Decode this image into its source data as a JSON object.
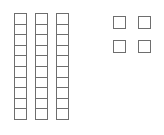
{
  "diagram": {
    "kind": "base-ten-blocks",
    "background_color": "#ffffff",
    "line_color": "#6e6e6e",
    "rods": {
      "count": 3,
      "cells_per_rod": 10,
      "cell_width": 13,
      "cell_height": 11.6,
      "top": 13,
      "positions_x": [
        14,
        35,
        56
      ]
    },
    "units": {
      "count": 4,
      "size": 13,
      "rows": 2,
      "columns": 2,
      "positions": [
        {
          "x": 113,
          "y": 16
        },
        {
          "x": 138,
          "y": 16
        },
        {
          "x": 113,
          "y": 40
        },
        {
          "x": 138,
          "y": 40
        }
      ]
    }
  },
  "chart_data": {
    "type": "bar",
    "title": "",
    "xlabel": "",
    "ylabel": "",
    "categories": [
      "rod-1",
      "rod-2",
      "rod-3",
      "units"
    ],
    "values": [
      10,
      10,
      10,
      4
    ],
    "total": 34,
    "tens": 3,
    "ones": 4
  }
}
